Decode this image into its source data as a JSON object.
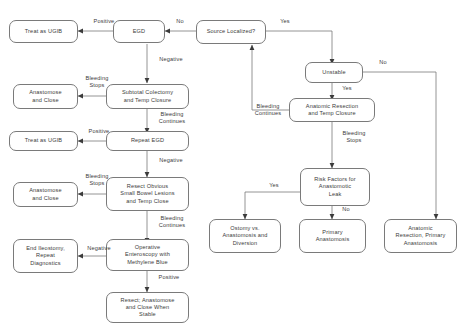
{
  "diagram": {
    "stroke_color": "#7a7a7a",
    "text_color": "#3b3b3b",
    "background": "#ffffff",
    "nodes": [
      {
        "id": "treat_ugib_1",
        "label": "Treat as UGIB"
      },
      {
        "id": "egd",
        "label": "EGD"
      },
      {
        "id": "source_localized",
        "label": "Source Localized?"
      },
      {
        "id": "unstable",
        "label": "Unstable"
      },
      {
        "id": "anastomose_close_1",
        "label": "Anastomose\nand Close"
      },
      {
        "id": "subtotal_colectomy",
        "label": "Subtotal Colectomy\nand Temp Closure"
      },
      {
        "id": "anatomic_resection_temp",
        "label": "Anatomic Resection\nand Temp Closure"
      },
      {
        "id": "treat_ugib_2",
        "label": "Treat as UGIB"
      },
      {
        "id": "repeat_egd",
        "label": "Repeat EGD"
      },
      {
        "id": "anastomose_close_2",
        "label": "Anastomose\nand Close"
      },
      {
        "id": "resect_obvious",
        "label": "Resect Obvious\nSmall Bowel Lesions\nand Temp Close"
      },
      {
        "id": "risk_factors",
        "label": "Risk Factors for\nAnastomotic\nLeak"
      },
      {
        "id": "end_ileostomy",
        "label": "End Ileostomy,\nRepeat\nDiagnostics"
      },
      {
        "id": "operative_enteroscopy",
        "label": "Operative\nEnteroscopy with\nMethylene Blue"
      },
      {
        "id": "ostomy_diversion",
        "label": "Ostomy vs.\nAnastomosis and\nDiversion"
      },
      {
        "id": "primary_anastomosis",
        "label": "Primary\nAnastomosis"
      },
      {
        "id": "anatomic_primary",
        "label": "Anatomic\nResection, Primary\nAnastomosis"
      },
      {
        "id": "resect_anastomose",
        "label": "Resect; Anastomose\nand Close When\nStable"
      }
    ],
    "edge_labels": [
      {
        "id": "positive_1",
        "label": "Positive"
      },
      {
        "id": "no_1",
        "label": "No"
      },
      {
        "id": "yes_1",
        "label": "Yes"
      },
      {
        "id": "negative_1",
        "label": "Negative"
      },
      {
        "id": "no_2",
        "label": "No"
      },
      {
        "id": "bleeding_stops_1",
        "label": "Bleeding\nStops"
      },
      {
        "id": "yes_2",
        "label": "Yes"
      },
      {
        "id": "bleeding_continues_1",
        "label": "Bleeding\nContinues"
      },
      {
        "id": "bleeding_continues_2",
        "label": "Bleeding\nContinues"
      },
      {
        "id": "positive_2",
        "label": "Positive"
      },
      {
        "id": "bleeding_stops_2",
        "label": "Bleeding\nStops"
      },
      {
        "id": "negative_2",
        "label": "Negative"
      },
      {
        "id": "bleeding_stops_3",
        "label": "Bleeding\nStops"
      },
      {
        "id": "yes_3",
        "label": "Yes"
      },
      {
        "id": "bleeding_continues_3",
        "label": "Bleeding\nContinues"
      },
      {
        "id": "negative_3",
        "label": "Negative"
      },
      {
        "id": "no_3",
        "label": "No"
      },
      {
        "id": "positive_3",
        "label": "Positive"
      }
    ]
  }
}
